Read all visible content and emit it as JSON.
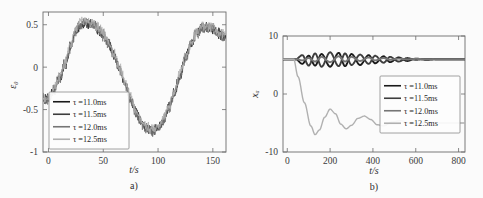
{
  "figure": {
    "panels": [
      {
        "id": "panel-a",
        "label": "a)",
        "xlabel": "t/s",
        "ylabel": "ε₀",
        "xticks": [
          "0",
          "50",
          "100",
          "150"
        ],
        "yticks": [
          "0.5",
          "0",
          "-0.5",
          "-1"
        ]
      },
      {
        "id": "panel-b",
        "label": "b)",
        "xlabel": "t/s",
        "ylabel": "xₐ",
        "xticks": [
          "0",
          "200",
          "400",
          "600",
          "800"
        ],
        "yticks": [
          "10",
          "0",
          "-10"
        ]
      }
    ],
    "legend": {
      "entries": [
        {
          "label": "τ =11.0ms",
          "color": "#1a1a1a"
        },
        {
          "label": "τ =11.5ms",
          "color": "#3d3d3d"
        },
        {
          "label": "τ =12.0ms",
          "color": "#767676"
        },
        {
          "label": "τ =12.5ms",
          "color": "#b0b0b0"
        }
      ]
    }
  },
  "chart_data": [
    {
      "type": "line",
      "panel": "a)",
      "title": "",
      "xlabel": "t/s",
      "ylabel": "ε₀",
      "xlim": [
        -5,
        162
      ],
      "ylim": [
        -1,
        0.65
      ],
      "xticks": [
        0,
        50,
        100,
        150
      ],
      "yticks": [
        0.5,
        0,
        -0.5,
        -1
      ],
      "grid": false,
      "legend_position": "lower-left",
      "description": "Four noisy overlapping sinusoidal traces rising from about -0.38 at t=0 to a peak near 0.55 at t=28, falling to a trough near -0.75 at t=95, then rising to about 0.45 by t=155. High-frequency noise of amplitude roughly 0.05 rides on all curves.",
      "series": [
        {
          "name": "τ =11.0ms",
          "color": "#1a1a1a",
          "x": [
            0,
            5,
            10,
            15,
            20,
            25,
            30,
            35,
            40,
            45,
            50,
            55,
            60,
            65,
            70,
            75,
            80,
            85,
            90,
            95,
            100,
            105,
            110,
            115,
            120,
            125,
            130,
            135,
            140,
            145,
            150,
            155,
            160
          ],
          "values": [
            -0.38,
            -0.27,
            -0.14,
            0.02,
            0.22,
            0.42,
            0.5,
            0.52,
            0.5,
            0.45,
            0.38,
            0.28,
            0.14,
            -0.02,
            -0.2,
            -0.38,
            -0.54,
            -0.66,
            -0.73,
            -0.75,
            -0.72,
            -0.62,
            -0.48,
            -0.3,
            -0.1,
            0.1,
            0.27,
            0.4,
            0.46,
            0.47,
            0.45,
            0.4,
            0.36
          ]
        },
        {
          "name": "τ =11.5ms",
          "color": "#3d3d3d",
          "x": [
            0,
            5,
            10,
            15,
            20,
            25,
            30,
            35,
            40,
            45,
            50,
            55,
            60,
            65,
            70,
            75,
            80,
            85,
            90,
            95,
            100,
            105,
            110,
            115,
            120,
            125,
            130,
            135,
            140,
            145,
            150,
            155,
            160
          ],
          "values": [
            -0.37,
            -0.26,
            -0.12,
            0.04,
            0.24,
            0.44,
            0.52,
            0.53,
            0.51,
            0.46,
            0.39,
            0.29,
            0.15,
            -0.01,
            -0.19,
            -0.37,
            -0.53,
            -0.65,
            -0.72,
            -0.74,
            -0.71,
            -0.61,
            -0.47,
            -0.29,
            -0.09,
            0.11,
            0.28,
            0.41,
            0.47,
            0.48,
            0.46,
            0.41,
            0.37
          ]
        },
        {
          "name": "τ =12.0ms",
          "color": "#767676",
          "x": [
            0,
            5,
            10,
            15,
            20,
            25,
            30,
            35,
            40,
            45,
            50,
            55,
            60,
            65,
            70,
            75,
            80,
            85,
            90,
            95,
            100,
            105,
            110,
            115,
            120,
            125,
            130,
            135,
            140,
            145,
            150,
            155,
            160
          ],
          "values": [
            -0.39,
            -0.28,
            -0.15,
            0.01,
            0.21,
            0.43,
            0.51,
            0.53,
            0.5,
            0.44,
            0.37,
            0.27,
            0.13,
            -0.03,
            -0.21,
            -0.39,
            -0.55,
            -0.67,
            -0.74,
            -0.76,
            -0.73,
            -0.63,
            -0.49,
            -0.31,
            -0.11,
            0.09,
            0.26,
            0.39,
            0.45,
            0.46,
            0.44,
            0.39,
            0.35
          ]
        },
        {
          "name": "τ =12.5ms",
          "color": "#b0b0b0",
          "x": [
            0,
            5,
            10,
            15,
            20,
            25,
            30,
            35,
            40,
            45,
            50,
            55,
            60,
            65,
            70,
            75,
            80,
            85,
            90,
            95,
            100,
            105,
            110,
            115,
            120,
            125,
            130,
            135,
            140,
            145,
            150,
            155,
            160
          ],
          "values": [
            -0.36,
            -0.25,
            -0.11,
            0.05,
            0.26,
            0.46,
            0.54,
            0.55,
            0.52,
            0.47,
            0.4,
            0.3,
            0.16,
            0.0,
            -0.18,
            -0.36,
            -0.52,
            -0.64,
            -0.71,
            -0.73,
            -0.7,
            -0.6,
            -0.46,
            -0.28,
            -0.08,
            0.12,
            0.29,
            0.42,
            0.48,
            0.49,
            0.47,
            0.42,
            0.38
          ]
        }
      ]
    },
    {
      "type": "line",
      "panel": "b)",
      "title": "",
      "xlabel": "t/s",
      "ylabel": "xₐ",
      "xlim": [
        -20,
        830
      ],
      "ylim": [
        -10,
        10
      ],
      "xticks": [
        0,
        200,
        400,
        600,
        800
      ],
      "yticks": [
        10,
        0,
        -10
      ],
      "grid": false,
      "legend_position": "right-middle",
      "description": "Three dark traces (11.0, 11.5, 12.0 ms) stay near x=6 with decaying criss-cross oscillations of amplitude about 1.5 that damp out by t=600. The light gray trace (12.5 ms) drops from 6 at t=40 to a minimum of -7 near t=130, then oscillates with decaying amplitude converging to about -5 by t=600.",
      "series": [
        {
          "name": "τ =11.0ms",
          "color": "#1a1a1a",
          "x": [
            0,
            40,
            70,
            100,
            130,
            160,
            200,
            240,
            270,
            300,
            340,
            380,
            410,
            450,
            480,
            520,
            560,
            600,
            650,
            700,
            750,
            800
          ],
          "values": [
            6.0,
            6.0,
            5.2,
            6.6,
            4.9,
            6.9,
            4.7,
            7.1,
            4.8,
            6.9,
            5.0,
            6.7,
            5.3,
            6.5,
            5.5,
            6.3,
            5.7,
            6.1,
            5.9,
            6.0,
            6.0,
            6.0
          ]
        },
        {
          "name": "τ =11.5ms",
          "color": "#3d3d3d",
          "x": [
            0,
            40,
            70,
            100,
            130,
            160,
            200,
            240,
            270,
            300,
            340,
            380,
            410,
            450,
            480,
            520,
            560,
            600,
            650,
            700,
            750,
            800
          ],
          "values": [
            6.0,
            6.0,
            6.7,
            4.9,
            7.0,
            4.7,
            7.2,
            4.8,
            7.0,
            5.0,
            6.8,
            5.2,
            6.6,
            5.4,
            6.4,
            5.6,
            6.2,
            5.9,
            6.05,
            6.0,
            6.0,
            6.0
          ]
        },
        {
          "name": "τ =12.0ms",
          "color": "#767676",
          "x": [
            0,
            40,
            70,
            100,
            130,
            160,
            200,
            240,
            270,
            300,
            340,
            380,
            410,
            450,
            480,
            520,
            560,
            600,
            650,
            700,
            750,
            800
          ],
          "values": [
            6.0,
            6.0,
            5.8,
            6.2,
            5.6,
            6.4,
            5.5,
            6.5,
            5.6,
            6.4,
            5.7,
            6.3,
            5.8,
            6.2,
            5.9,
            6.1,
            5.95,
            6.05,
            6.0,
            6.0,
            6.0,
            6.0
          ]
        },
        {
          "name": "τ =12.5ms",
          "color": "#b0b0b0",
          "x": [
            0,
            30,
            50,
            80,
            110,
            130,
            150,
            175,
            200,
            225,
            250,
            275,
            300,
            330,
            360,
            390,
            420,
            450,
            490,
            530,
            570,
            610,
            660,
            710,
            760,
            800
          ],
          "values": [
            6.0,
            6.0,
            3.0,
            -1.5,
            -5.5,
            -7.0,
            -6.2,
            -4.0,
            -2.6,
            -3.4,
            -5.2,
            -6.0,
            -5.4,
            -4.2,
            -3.8,
            -4.4,
            -5.3,
            -5.5,
            -4.8,
            -4.6,
            -5.0,
            -5.1,
            -4.9,
            -5.0,
            -5.0,
            -5.0
          ]
        }
      ]
    }
  ]
}
